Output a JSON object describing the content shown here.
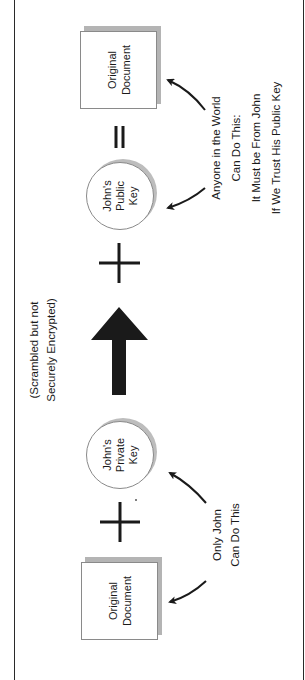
{
  "diagram": {
    "title": "",
    "orientation": "rotated 90 degrees counter-clockwise",
    "colors": {
      "ink": "#1a1a1a",
      "frame": "#2a2a2a",
      "shadow": "#b4b4b4",
      "outline": "#8a8a8a",
      "background": "#ffffff"
    },
    "left_document": {
      "line1": "Original",
      "line2": "Document"
    },
    "private_key": {
      "line1": "John's",
      "line2": "Private",
      "line3": "Key"
    },
    "operator_plus_1": "+",
    "transform_arrow": {
      "icon": "thick-arrow-right",
      "caption_line1": "(Scrambled but not",
      "caption_line2": "Securely Encrypted)"
    },
    "operator_plus_2": "+",
    "public_key": {
      "line1": "John's",
      "line2": "Public",
      "line3": "Key"
    },
    "operator_equals": "=",
    "right_document": {
      "line1": "Original",
      "line2": "Document"
    },
    "left_annotation": {
      "line1": "Only John",
      "line2": "Can Do This"
    },
    "right_annotation": {
      "line1": "Anyone in the World",
      "line2": "Can Do This:",
      "line3": "It Must be From John",
      "line4": "If We Trust His Public Key"
    }
  }
}
